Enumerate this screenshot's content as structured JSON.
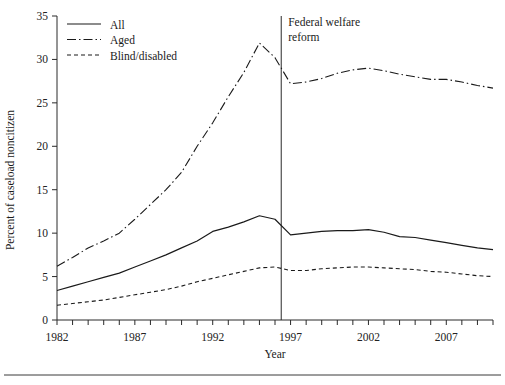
{
  "chart_data": {
    "type": "line",
    "title": "",
    "xlabel": "Year",
    "ylabel": "Percent of caseload noncitizen",
    "xlim": [
      1982,
      2010
    ],
    "ylim": [
      0,
      35
    ],
    "grid": false,
    "legend_position": "top-left",
    "x": [
      1982,
      1983,
      1984,
      1985,
      1986,
      1987,
      1988,
      1989,
      1990,
      1991,
      1992,
      1993,
      1994,
      1995,
      1996,
      1997,
      1998,
      1999,
      2000,
      2001,
      2002,
      2003,
      2004,
      2005,
      2006,
      2007,
      2008,
      2009,
      2010
    ],
    "xticks": [
      1982,
      1983,
      1984,
      1985,
      1986,
      1987,
      1988,
      1989,
      1990,
      1991,
      1992,
      1993,
      1994,
      1995,
      1996,
      1997,
      1998,
      1999,
      2000,
      2001,
      2002,
      2003,
      2004,
      2005,
      2006,
      2007,
      2008,
      2009,
      2010
    ],
    "xtick_labels": [
      {
        "value": 1982,
        "label": "1982"
      },
      {
        "value": 1987,
        "label": "1987"
      },
      {
        "value": 1992,
        "label": "1992"
      },
      {
        "value": 1997,
        "label": "1997"
      },
      {
        "value": 2002,
        "label": "2002"
      },
      {
        "value": 2007,
        "label": "2007"
      }
    ],
    "yticks": [
      0,
      5,
      10,
      15,
      20,
      25,
      30,
      35
    ],
    "ytick_labels": [
      "0",
      "5",
      "10",
      "15",
      "20",
      "25",
      "30",
      "35"
    ],
    "series": [
      {
        "name": "All",
        "style": "solid",
        "values": [
          3.4,
          3.9,
          4.4,
          4.9,
          5.4,
          6.1,
          6.8,
          7.5,
          8.3,
          9.1,
          10.2,
          10.7,
          11.3,
          12.0,
          11.6,
          9.8,
          10.0,
          10.2,
          10.3,
          10.3,
          10.4,
          10.1,
          9.6,
          9.5,
          9.2,
          8.9,
          8.6,
          8.3,
          8.1
        ]
      },
      {
        "name": "Aged",
        "style": "dash-dot",
        "values": [
          6.2,
          7.2,
          8.3,
          9.1,
          10.0,
          11.6,
          13.3,
          15.0,
          17.0,
          20.0,
          22.7,
          25.7,
          28.5,
          31.9,
          30.2,
          27.2,
          27.4,
          27.8,
          28.4,
          28.8,
          29.0,
          28.7,
          28.3,
          28.0,
          27.7,
          27.7,
          27.4,
          27.0,
          26.7
        ]
      },
      {
        "name": "Blind/disabled",
        "style": "dotted",
        "values": [
          1.7,
          1.9,
          2.1,
          2.3,
          2.6,
          2.9,
          3.2,
          3.5,
          3.9,
          4.4,
          4.8,
          5.2,
          5.6,
          6.0,
          6.1,
          5.7,
          5.7,
          5.9,
          6.0,
          6.1,
          6.1,
          6.0,
          5.9,
          5.8,
          5.6,
          5.5,
          5.3,
          5.1,
          5.0
        ]
      }
    ],
    "annotations": [
      {
        "name": "federal-welfare-reform",
        "x": 1996.4,
        "line1": "Federal welfare",
        "line2": "reform",
        "type": "vline"
      }
    ]
  }
}
